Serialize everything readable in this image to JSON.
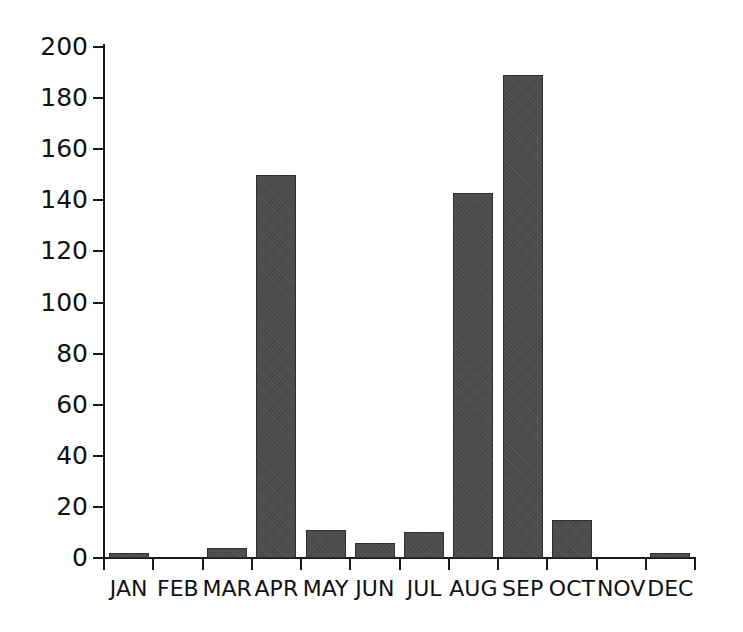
{
  "chart_data": {
    "type": "bar",
    "title": "",
    "subtitle": "",
    "xlabel": "",
    "ylabel": "",
    "categories": [
      "JAN",
      "FEB",
      "MAR",
      "APR",
      "MAY",
      "JUN",
      "JUL",
      "AUG",
      "SEP",
      "OCT",
      "NOV",
      "DEC"
    ],
    "values": [
      2,
      0,
      4,
      150,
      11,
      6,
      10,
      143,
      189,
      15,
      0,
      2
    ],
    "ylim": [
      0,
      200
    ],
    "ytick_labels": [
      "200",
      "180",
      "160",
      "140",
      "120",
      "100",
      "80",
      "60",
      "40",
      "20",
      "0"
    ],
    "ytick_values": [
      200,
      180,
      160,
      140,
      120,
      100,
      80,
      60,
      40,
      20,
      0
    ],
    "ytick_step": 20,
    "grid": false,
    "legend": null,
    "legend_position": "none",
    "annotations": [],
    "bar_color": "#4c4c4c",
    "axis_color": "#1a1a1a",
    "background_color": "#ffffff"
  }
}
